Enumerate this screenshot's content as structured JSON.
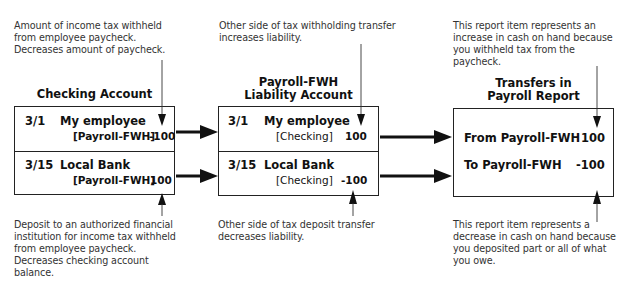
{
  "annotations": {
    "top_left": "Amount of income tax withheld\nfrom employee paycheck.\nDecreases amount of paycheck.",
    "top_middle": "Other side of tax withholding transfer\nincreases liability.",
    "top_right": "This report item represents an\nincrease in cash on hand because\nyou withheld tax from the\npaycheck.",
    "bottom_left": "Deposit to an authorized financial\ninstitution for income tax withheld\nfrom employee paycheck.\nDecreases checking account\nbalance.",
    "bottom_middle": "Other side of tax deposit transfer\ndecreases liability.",
    "bottom_right": "This report item represents a\ndecrease in cash on hand because\nyou deposited part or all of what\nyou owe."
  },
  "checking_account": {
    "title": "Checking Account",
    "rows": [
      {
        "date": "3/1",
        "payee": "My employee",
        "category": "[Payroll-FWH]",
        "amount": "-100"
      },
      {
        "date": "3/15",
        "payee": "Local Bank",
        "category": "[Payroll-FWH]",
        "amount": "100"
      }
    ]
  },
  "liability_account": {
    "title_line1": "Payroll-FWH",
    "title_line2": "Liability Account",
    "rows": [
      {
        "date": "3/1",
        "payee": "My employee",
        "category": "[Checking]",
        "amount": "100"
      },
      {
        "date": "3/15",
        "payee": "Local Bank",
        "category": "[Checking]",
        "amount": "-100"
      }
    ]
  },
  "payroll_report": {
    "title_line1": "Transfers in",
    "title_line2": "Payroll Report",
    "rows": [
      {
        "label": "From Payroll-FWH",
        "amount": "100"
      },
      {
        "label": "To Payroll-FWH",
        "amount": "-100"
      }
    ]
  },
  "colors": {
    "line": "#222222",
    "note_text": "#333333"
  }
}
